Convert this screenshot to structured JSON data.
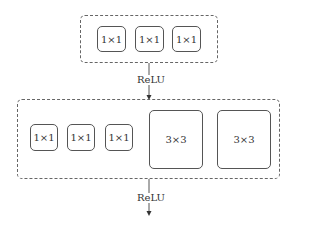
{
  "diagram": {
    "top_group": {
      "kernels": [
        {
          "label": "1×1"
        },
        {
          "label": "1×1"
        },
        {
          "label": "1×1"
        }
      ]
    },
    "connector_1": {
      "label": "ReLU"
    },
    "bottom_group": {
      "kernels": [
        {
          "label": "1×1"
        },
        {
          "label": "1×1"
        },
        {
          "label": "1×1"
        },
        {
          "label": "3×3"
        },
        {
          "label": "3×3"
        }
      ]
    },
    "connector_2": {
      "label": "ReLU"
    }
  }
}
